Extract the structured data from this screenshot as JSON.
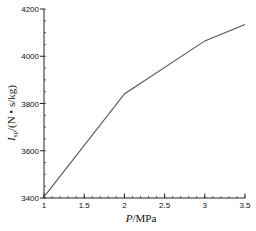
{
  "chart_data": {
    "type": "line",
    "title": "",
    "xlabel": "P / MPa",
    "xlabel_parts": {
      "var": "P",
      "unit": "/MPa"
    },
    "ylabel": "I_sp/(N • s/kg)",
    "ylabel_parts": {
      "var": "I",
      "sub": "sp",
      "unit": "/(N • s/kg)"
    },
    "xlim": [
      1,
      3.5
    ],
    "ylim": [
      3400,
      4200
    ],
    "xticks": [
      1,
      1.5,
      2,
      2.5,
      3,
      3.5
    ],
    "xtick_labels": [
      "1",
      "1.5",
      "2",
      "2.5",
      "3",
      "3.5"
    ],
    "yticks": [
      3400,
      3600,
      3800,
      4000,
      4200
    ],
    "ytick_labels": [
      "3400",
      "3600",
      "3800",
      "4000",
      "4200"
    ],
    "x_minor_step": 0.1,
    "y_minor_step": 50,
    "grid": false,
    "legend": null,
    "series": [
      {
        "name": "I_sp",
        "color": "#555555",
        "x": [
          1,
          2,
          3,
          3.5
        ],
        "values": [
          3405,
          3840,
          4065,
          4135
        ]
      }
    ]
  },
  "colors": {
    "axis": "#222222",
    "line": "#555555",
    "text": "#111111",
    "background": "#ffffff"
  }
}
